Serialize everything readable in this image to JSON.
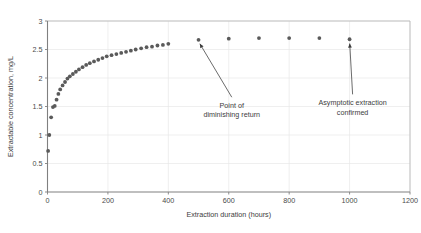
{
  "chart_data": {
    "type": "scatter",
    "title": "",
    "xlabel": "Extraction duration (hours)",
    "ylabel": "Extractable concentration, mg/L",
    "xlim": [
      0,
      1200
    ],
    "ylim": [
      0,
      3
    ],
    "xticks": [
      0,
      200,
      400,
      600,
      800,
      1000,
      1200
    ],
    "xticklabels": [
      "0",
      "200",
      "400",
      "600",
      "800",
      "1000",
      "1200"
    ],
    "yticks": [
      0,
      0.5,
      1,
      1.5,
      2,
      2.5,
      3
    ],
    "yticklabels": [
      "0",
      "0.5",
      "1",
      "1.5",
      "2",
      "2.5",
      "3"
    ],
    "grid": true,
    "legend": null,
    "marker": {
      "shape": "circle",
      "color": "#5a5a5a",
      "size": 1.9
    },
    "series": [
      {
        "name": "Extractable concentration",
        "x": [
          2,
          6,
          12,
          18,
          24,
          30,
          36,
          42,
          50,
          58,
          66,
          74,
          84,
          94,
          104,
          116,
          128,
          140,
          154,
          168,
          182,
          196,
          212,
          228,
          244,
          260,
          276,
          292,
          310,
          328,
          346,
          364,
          382,
          400,
          500,
          600,
          700,
          800,
          900,
          1000
        ],
        "y": [
          0.72,
          1.0,
          1.31,
          1.49,
          1.51,
          1.62,
          1.72,
          1.8,
          1.87,
          1.93,
          1.99,
          2.03,
          2.07,
          2.11,
          2.15,
          2.19,
          2.23,
          2.26,
          2.29,
          2.32,
          2.35,
          2.38,
          2.4,
          2.42,
          2.44,
          2.46,
          2.48,
          2.5,
          2.52,
          2.54,
          2.55,
          2.57,
          2.58,
          2.6,
          2.67,
          2.69,
          2.7,
          2.7,
          2.7,
          2.68
        ]
      }
    ],
    "annotations": [
      {
        "id": "diminishing-return",
        "text_lines": [
          "Point of",
          "diminishing return"
        ],
        "text_x": 610,
        "text_y": 1.47,
        "target_x": 500,
        "target_y": 2.64
      },
      {
        "id": "asymptotic-extraction",
        "text_lines": [
          "Asymptotic extraction",
          "confirmed"
        ],
        "text_x": 1010,
        "text_y": 1.52,
        "target_x": 1000,
        "target_y": 2.65
      }
    ],
    "colors": {
      "marker": "#5a5a5a",
      "axis": "#808080",
      "grid": "#e8e8e8",
      "frame": "#b4b4b4",
      "text": "#3d3d3d",
      "annotation_arrow": "#3a3a3a"
    }
  }
}
